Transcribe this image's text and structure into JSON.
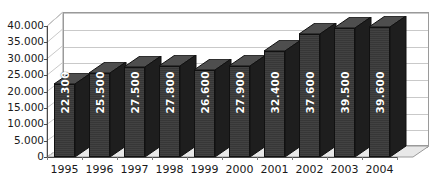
{
  "chart_data": {
    "type": "bar",
    "title": "",
    "subtitle": "",
    "xlabel": "",
    "ylabel": "",
    "categories": [
      "1995",
      "1996",
      "1997",
      "1998",
      "1999",
      "2000",
      "2001",
      "2002",
      "2003",
      "2004"
    ],
    "values": [
      22300,
      25500,
      27500,
      27800,
      26600,
      27900,
      32400,
      37600,
      39500,
      39600
    ],
    "value_labels": [
      "22.300",
      "25.500",
      "27.500",
      "27.800",
      "26.600",
      "27.900",
      "32.400",
      "37.600",
      "39.500",
      "39.600"
    ],
    "ylim": [
      0,
      40000
    ],
    "ytick_values": [
      0,
      5000,
      10000,
      15000,
      20000,
      25000,
      30000,
      35000,
      40000
    ],
    "ytick_labels": [
      "0",
      "5.000",
      "10.000",
      "15.000",
      "20.000",
      "25.000",
      "30.000",
      "35.000",
      "40.000"
    ],
    "grid": true,
    "legend": false,
    "legend_position": "none",
    "style": "3d-column",
    "series": [
      {
        "name": "",
        "values": [
          22300,
          25500,
          27500,
          27800,
          26600,
          27900,
          32400,
          37600,
          39500,
          39600
        ]
      }
    ],
    "colors": {
      "bar_front": "#3a3a3a",
      "bar_top": "#4e4e4e",
      "bar_side": "#1e1e1e",
      "bar_outline": "#111111",
      "gridline": "#c9c9c9",
      "axis": "#4a4a4a",
      "plot_background": "#ffffff",
      "floor": "#e8e8e8",
      "wall_border": "#9a9a9a",
      "label_text": "#ffffff",
      "tick_text": "#1a1a1a"
    }
  }
}
